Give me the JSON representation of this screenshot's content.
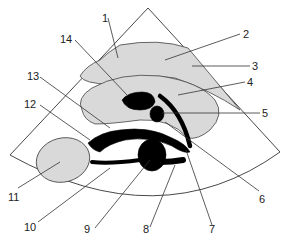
{
  "figure": {
    "type": "ultrasound-schematic",
    "colors": {
      "background": "#ffffff",
      "organ_fill": "#d9d9d9",
      "vessel_fill": "#000000",
      "line": "#333333"
    },
    "labels": [
      {
        "id": "1",
        "text": "1"
      },
      {
        "id": "2",
        "text": "2"
      },
      {
        "id": "3",
        "text": "3"
      },
      {
        "id": "4",
        "text": "4"
      },
      {
        "id": "5",
        "text": "5"
      },
      {
        "id": "6",
        "text": "6"
      },
      {
        "id": "7",
        "text": "7"
      },
      {
        "id": "8",
        "text": "8"
      },
      {
        "id": "9",
        "text": "9"
      },
      {
        "id": "10",
        "text": "10"
      },
      {
        "id": "11",
        "text": "11"
      },
      {
        "id": "12",
        "text": "12"
      },
      {
        "id": "13",
        "text": "13"
      },
      {
        "id": "14",
        "text": "14"
      }
    ]
  }
}
